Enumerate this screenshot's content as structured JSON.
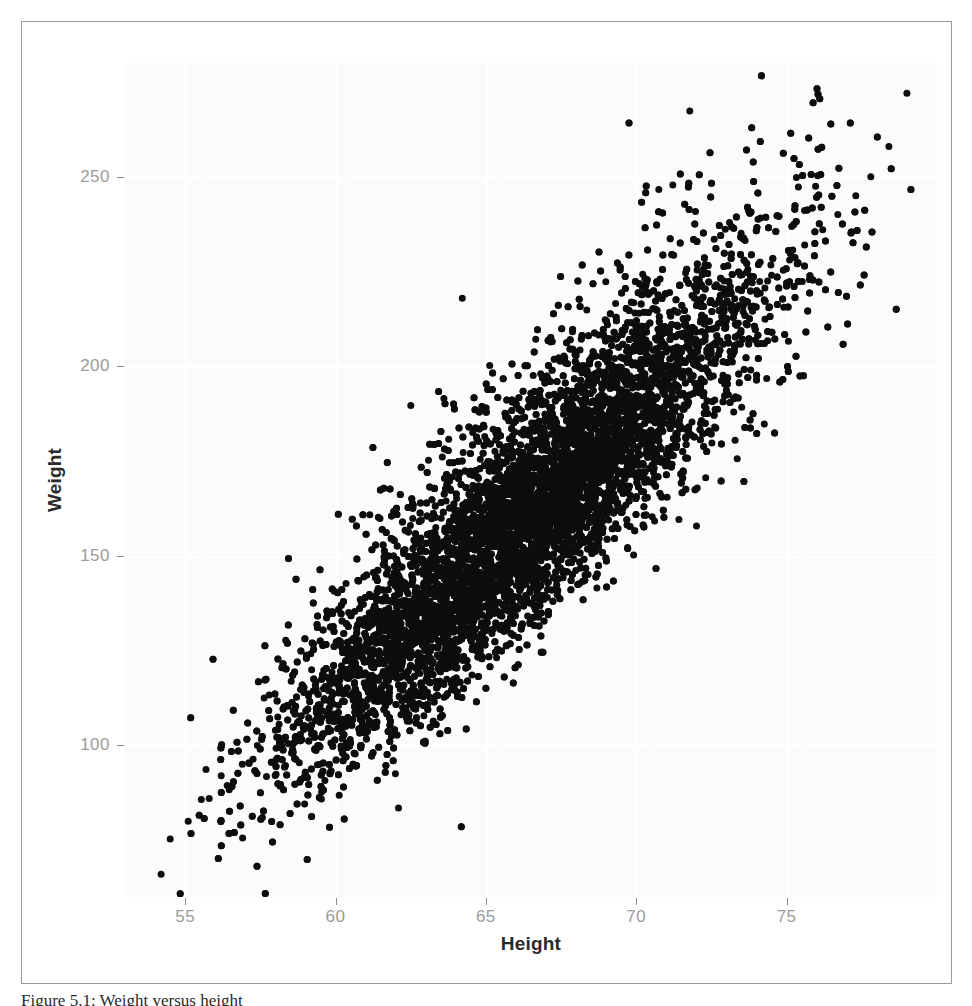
{
  "figure": {
    "caption": "Figure 5.1: Weight versus height",
    "frame_color": "#9a9a9a",
    "panel_background": "#fbfbfb",
    "point_color": "#0d0d0d"
  },
  "chart_data": {
    "type": "scatter",
    "title": "",
    "xlabel": "Height",
    "ylabel": "Weight",
    "xlim": [
      53,
      80
    ],
    "ylim": [
      60,
      280
    ],
    "xticks": [
      55,
      60,
      65,
      70,
      75
    ],
    "yticks": [
      100,
      150,
      200,
      250
    ],
    "xtick_labels": [
      "55",
      "60",
      "65",
      "70",
      "75"
    ],
    "ytick_labels": [
      "100",
      "150",
      "200",
      "250"
    ],
    "grid": true,
    "legend": null,
    "n_points": 9800,
    "marker": "filled-circle",
    "marker_size_px": 7,
    "distribution": {
      "x_mean": 66.4,
      "x_sd": 3.85,
      "y_mean": 161.0,
      "y_sd": 33.0,
      "correlation": 0.87
    },
    "extremes": {
      "max_point": [
        79.0,
        272.0
      ],
      "min_point": [
        54.2,
        66.0
      ],
      "x_range_observed": [
        54.0,
        79.2
      ],
      "y_range_observed": [
        65.0,
        272.0
      ]
    },
    "series": [
      {
        "name": "observations",
        "x": [
          54.2,
          55.1,
          55.8,
          56.2,
          56.9,
          57.4,
          58.0,
          58.6,
          59.1,
          59.7,
          60.2,
          60.8,
          61.3,
          61.9,
          62.4,
          63.0,
          63.5,
          64.1,
          64.6,
          65.2,
          65.7,
          66.3,
          66.8,
          67.4,
          67.9,
          68.5,
          69.0,
          69.6,
          70.1,
          70.7,
          71.2,
          71.8,
          72.3,
          72.9,
          73.4,
          74.0,
          74.5,
          75.1,
          75.6,
          76.2,
          76.7,
          77.3,
          77.8,
          78.4,
          79.0
        ],
        "y": [
          66.0,
          80.0,
          86.0,
          92.0,
          95.0,
          100.0,
          104.0,
          109.0,
          113.0,
          118.0,
          121.0,
          125.0,
          129.0,
          133.0,
          137.0,
          141.0,
          145.0,
          149.0,
          153.0,
          157.0,
          160.0,
          164.0,
          168.0,
          172.0,
          176.0,
          180.0,
          184.0,
          188.0,
          192.0,
          196.0,
          200.0,
          204.0,
          208.0,
          212.0,
          216.0,
          220.0,
          224.0,
          228.0,
          232.0,
          236.0,
          240.0,
          245.0,
          250.0,
          258.0,
          272.0
        ]
      }
    ]
  }
}
